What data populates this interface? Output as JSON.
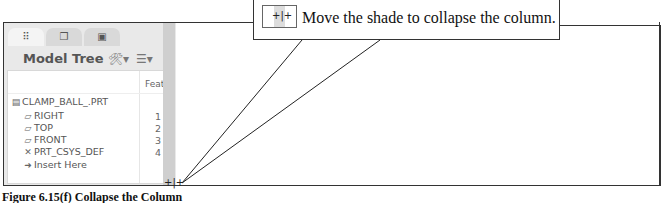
{
  "panel": {
    "tabs": [
      {
        "icon": "model-tree-icon",
        "glyph": "⠿",
        "active": true
      },
      {
        "icon": "layers-icon",
        "glyph": "❐",
        "active": false
      },
      {
        "icon": "folder-icon",
        "glyph": "▣",
        "active": false
      }
    ],
    "title": "Model Tree",
    "tools": [
      {
        "icon": "settings-icon",
        "glyph": "🛠▾"
      },
      {
        "icon": "show-icon",
        "glyph": "☰▾"
      }
    ],
    "column_header": "Feat",
    "tree": [
      {
        "icon": "part-icon",
        "glyph": "▤",
        "label": "CLAMP_BALL_.PRT",
        "feat": "",
        "indent": 0
      },
      {
        "icon": "datum-plane-icon",
        "glyph": "▱",
        "label": "RIGHT",
        "feat": "1",
        "indent": 1
      },
      {
        "icon": "datum-plane-icon",
        "glyph": "▱",
        "label": "TOP",
        "feat": "2",
        "indent": 1
      },
      {
        "icon": "datum-plane-icon",
        "glyph": "▱",
        "label": "FRONT",
        "feat": "3",
        "indent": 1
      },
      {
        "icon": "csys-icon",
        "glyph": "✕",
        "label": "PRT_CSYS_DEF",
        "feat": "4",
        "indent": 1
      },
      {
        "icon": "insert-arrow-icon",
        "glyph": "➜",
        "label": "Insert Here",
        "feat": "",
        "indent": 1
      }
    ],
    "collapse_handle_glyph": "+|+"
  },
  "callout": {
    "icon_glyph": "+|+",
    "text": "Move the shade to collapse the column."
  },
  "caption": "Figure 6.15(f) Collapse the Column"
}
